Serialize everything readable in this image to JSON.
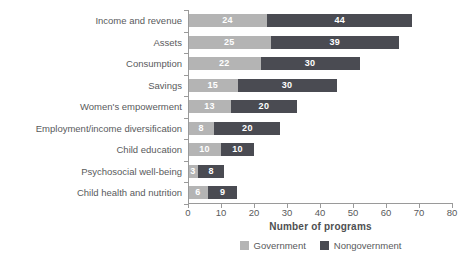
{
  "chart_data": {
    "type": "bar",
    "orientation": "horizontal",
    "stacked": true,
    "title": "",
    "xlabel": "Number of programs",
    "ylabel": "",
    "xlim": [
      0,
      80
    ],
    "xticks": [
      0,
      10,
      20,
      30,
      40,
      50,
      60,
      70,
      80
    ],
    "grid": "off",
    "legend_position": "bottom-center",
    "categories": [
      "Income and revenue",
      "Assets",
      "Consumption",
      "Savings",
      "Women's empowerment",
      "Employment/income diversification",
      "Child education",
      "Psychosocial well-being",
      "Child health and nutrition"
    ],
    "series": [
      {
        "name": "Government",
        "color": "#b4b4b4",
        "values": [
          24,
          25,
          22,
          15,
          13,
          8,
          10,
          3,
          6
        ]
      },
      {
        "name": "Nongovernment",
        "color": "#4a4b52",
        "values": [
          44,
          39,
          30,
          30,
          20,
          20,
          10,
          8,
          9
        ]
      }
    ],
    "totals": [
      68,
      64,
      52,
      45,
      33,
      28,
      20,
      11,
      15
    ],
    "value_label_color": "#ffffff"
  },
  "colors": {
    "axis_line": "#9a9a9a",
    "tick_text": "#595a5c",
    "category_text": "#595a5c",
    "axis_title_text": "#4e4f51",
    "background": "#ffffff"
  }
}
